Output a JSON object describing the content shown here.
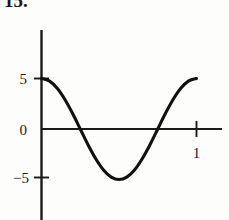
{
  "figure": {
    "problem_number": "15."
  },
  "chart_data": {
    "type": "line",
    "title": "",
    "subtitle": "",
    "xlabel": "",
    "ylabel": "",
    "grid": false,
    "legend": null,
    "xlim": [
      -0.08,
      1.25
    ],
    "ylim": [
      -7.8,
      9.6
    ],
    "x_ticks": [
      1
    ],
    "x_tick_labels": [
      "1"
    ],
    "y_ticks": [
      5,
      0,
      -5
    ],
    "y_tick_labels": [
      "5",
      "0",
      "−5"
    ],
    "axis_color": "#1a1a1a",
    "curve_color": "#111111",
    "series": [
      {
        "name": "y = 5 cos(2πx)",
        "x": [
          0.0,
          0.05,
          0.1,
          0.15,
          0.2,
          0.25,
          0.3,
          0.35,
          0.4,
          0.45,
          0.5,
          0.55,
          0.6,
          0.65,
          0.7,
          0.75,
          0.8,
          0.85,
          0.9,
          0.95,
          1.0
        ],
        "y": [
          5.0,
          4.76,
          4.05,
          2.94,
          1.55,
          0.0,
          -1.55,
          -2.94,
          -4.05,
          -4.76,
          -5.0,
          -4.76,
          -4.05,
          -2.94,
          -1.55,
          0.0,
          1.55,
          2.94,
          4.05,
          4.76,
          5.0
        ]
      }
    ],
    "annotations": [
      {
        "text": "zero crossing",
        "x": 0.25,
        "y": 0
      },
      {
        "text": "minimum",
        "x": 0.5,
        "y": -5
      },
      {
        "text": "zero crossing",
        "x": 0.75,
        "y": 0
      }
    ]
  }
}
